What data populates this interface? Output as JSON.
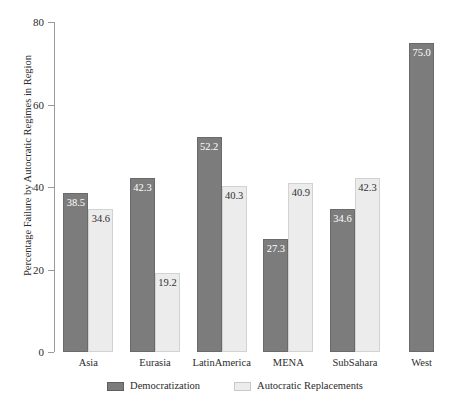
{
  "chart_data": {
    "type": "bar",
    "title": "",
    "xlabel": "",
    "ylabel": "Percentage Failure by Autocratic Regimes in Region",
    "ylim": [
      0,
      80
    ],
    "yticks": [
      0,
      20,
      40,
      60,
      80
    ],
    "ytick_labels": [
      "0",
      "20",
      "40",
      "60",
      "80"
    ],
    "grid": false,
    "legend_position": "bottom-center",
    "categories": [
      "Asia",
      "Eurasia",
      "LatinAmerica",
      "MENA",
      "SubSahara",
      "West"
    ],
    "series": [
      {
        "name": "Democratization",
        "color": "#7c7c7c",
        "values": [
          38.5,
          42.3,
          52.2,
          27.3,
          34.6,
          75.0
        ],
        "data_labels": [
          "38.5",
          "42.3",
          "52.2",
          "27.3",
          "34.6",
          "75.0"
        ]
      },
      {
        "name": "Autocratic Replacements",
        "color": "#ececec",
        "values": [
          34.6,
          19.2,
          40.3,
          40.9,
          42.3,
          null
        ],
        "data_labels": [
          "34.6",
          "19.2",
          "40.3",
          "40.9",
          "42.3",
          ""
        ]
      }
    ]
  },
  "axis": {
    "y_title": "Percentage Failure by Autocratic Regimes in Region"
  },
  "legend": {
    "items": [
      {
        "label": "Democratization"
      },
      {
        "label": "Autocratic Replacements"
      }
    ]
  },
  "caption_remnant": "cropped caption text above figure"
}
